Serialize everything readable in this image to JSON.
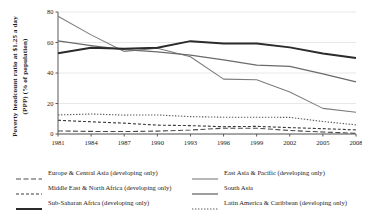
{
  "chart_data": {
    "type": "line",
    "title": "",
    "xlabel": "",
    "ylabel": "Poverty headcount ratio at $1.25 a day (PPP) (% of population)",
    "ylabel_line1": "Poverty headcount ratio at $1.25 a day",
    "ylabel_line2": "(PPP) (% of population)",
    "x": [
      1981,
      1984,
      1987,
      1990,
      1993,
      1996,
      1999,
      2002,
      2005,
      2008
    ],
    "xticklabels": [
      "1981",
      "1984",
      "1987",
      "1990",
      "1993",
      "1996",
      "1999",
      "2002",
      "2005",
      "2008"
    ],
    "yticklabels": [
      "0",
      "20",
      "40",
      "60",
      "80"
    ],
    "yticks": [
      0,
      20,
      40,
      60,
      80
    ],
    "xlim": [
      1981,
      2008
    ],
    "ylim": [
      0,
      80
    ],
    "grid": "horizontal",
    "legend_position": "bottom",
    "series": [
      {
        "name": "Europe & Central Asia (developing only)",
        "style": "long-dash",
        "color": "#4a4a4a",
        "width": 1.1,
        "dash": "5,2.5",
        "values": [
          2.0,
          1.7,
          1.6,
          1.9,
          2.6,
          3.8,
          3.8,
          2.3,
          1.3,
          0.5
        ]
      },
      {
        "name": "East Asia & Pacific (developing only)",
        "style": "solid",
        "color": "#7d7d7d",
        "width": 1.1,
        "dash": "",
        "values": [
          77.2,
          65.0,
          54.1,
          56.2,
          50.7,
          36.0,
          35.6,
          27.6,
          16.8,
          14.3
        ]
      },
      {
        "name": "Middle East & North Africa (developing only)",
        "style": "dash",
        "color": "#3a3a3a",
        "width": 1.1,
        "dash": "3,2",
        "values": [
          9.0,
          8.0,
          7.1,
          5.8,
          5.5,
          4.8,
          5.0,
          4.2,
          3.5,
          2.7
        ]
      },
      {
        "name": "South Asia",
        "style": "solid",
        "color": "#6a6a6a",
        "width": 1.3,
        "dash": "",
        "values": [
          61.1,
          58.0,
          55.3,
          53.8,
          51.7,
          48.6,
          45.1,
          44.3,
          39.4,
          34.2
        ]
      },
      {
        "name": "Sub-Saharan Africa (developing only)",
        "style": "solid-thick",
        "color": "#2b2b2b",
        "width": 2.0,
        "dash": "",
        "values": [
          53.0,
          56.5,
          55.9,
          56.5,
          60.9,
          59.4,
          59.4,
          56.8,
          52.8,
          49.9
        ]
      },
      {
        "name": "Latin America & Caribbean (developing only)",
        "style": "dotted",
        "color": "#5a5a5a",
        "width": 1.1,
        "dash": "1.4,1.6",
        "values": [
          12.5,
          13.1,
          12.4,
          12.5,
          11.4,
          11.0,
          11.0,
          10.9,
          8.2,
          6.0
        ]
      }
    ]
  },
  "legend": {
    "rows": [
      {
        "left": {
          "label": "Europe & Central Asia (developing only)",
          "series": 0
        },
        "right": {
          "label": "East Asia & Pacific (developing only)",
          "series": 1
        }
      },
      {
        "left": {
          "label": "Middle East & North Africa (developing only)",
          "series": 2
        },
        "right": {
          "label": "South Asia",
          "series": 3
        }
      },
      {
        "left": {
          "label": "Sub-Saharan Africa (developing only)",
          "series": 4
        },
        "right": {
          "label": "Latin America & Caribbean (developing only)",
          "series": 5
        }
      }
    ]
  },
  "colors": {
    "axis": "#595959",
    "grid": "#e2e2e2",
    "text": "#1a1a1a",
    "background": "#ffffff"
  }
}
